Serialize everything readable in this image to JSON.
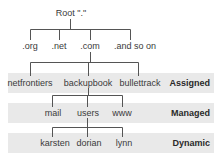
{
  "root": {
    "label": "Root \".\""
  },
  "tld": [
    {
      "label": ".org"
    },
    {
      "label": ".net"
    },
    {
      "label": ".com"
    },
    {
      "label": ".and so on"
    }
  ],
  "assigned": [
    {
      "label": "netfrontiers"
    },
    {
      "label": "backupbook"
    },
    {
      "label": "bullettrack"
    }
  ],
  "managed": [
    {
      "label": "mail"
    },
    {
      "label": "users"
    },
    {
      "label": "www"
    }
  ],
  "dynamic": [
    {
      "label": "karsten"
    },
    {
      "label": "dorian"
    },
    {
      "label": "lynn"
    }
  ],
  "tiers": {
    "assigned": "Assigned",
    "managed": "Managed",
    "dynamic": "Dynamic"
  },
  "colors": {
    "band": "#e9e9e9",
    "line": "#555555"
  }
}
